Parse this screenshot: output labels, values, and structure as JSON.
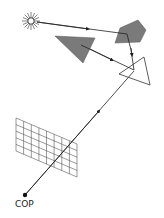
{
  "diagram": {
    "labels": {
      "cop": "COP"
    },
    "elements": [
      {
        "name": "light-source",
        "shape": "sun",
        "center": [
          31,
          21
        ]
      },
      {
        "name": "pentagon-object",
        "shape": "pentagon",
        "fill": "#7a7a7a"
      },
      {
        "name": "dark-triangle-object",
        "shape": "triangle",
        "fill": "#7a7a7a"
      },
      {
        "name": "outline-triangle-object",
        "shape": "triangle",
        "fill": "none"
      },
      {
        "name": "image-plane-grid",
        "shape": "grid",
        "rows": 5,
        "cols": 8
      },
      {
        "name": "center-of-projection",
        "shape": "dot"
      }
    ],
    "colors": {
      "stroke": "#333333",
      "object_fill": "#7a7a7a",
      "background": "#ffffff"
    }
  }
}
